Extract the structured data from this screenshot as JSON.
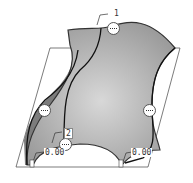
{
  "viewport": {
    "background": "#ffffff",
    "surface_color": "#a8a8a8",
    "surface_highlight": "#d6d6d6",
    "side_face_color": "#7a7a7a",
    "edge_color": "#333333",
    "plane_color": "#444444"
  },
  "labels": {
    "top_index": "1",
    "bottom_index": "2",
    "left_value": "0.00",
    "right_value": "0.00"
  },
  "markers": [
    {
      "name": "top-connection-marker"
    },
    {
      "name": "left-connection-marker"
    },
    {
      "name": "right-connection-marker"
    },
    {
      "name": "bottom-connection-marker"
    }
  ]
}
